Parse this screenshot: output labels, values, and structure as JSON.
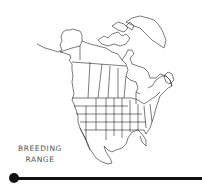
{
  "figure": {
    "label_lines": [
      "BREEDING",
      "RANGE"
    ],
    "colors": {
      "stroke": "#222222",
      "label": "#555555",
      "timeline": "#111111",
      "background": "#ffffff"
    }
  }
}
